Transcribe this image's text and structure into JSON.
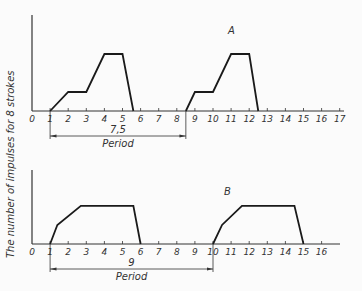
{
  "y_axis_label": "The number of impulses for 8 strokes",
  "panels": [
    {
      "id": "A",
      "label": "A",
      "x_ticks": [
        "0",
        "1",
        "2",
        "3",
        "4",
        "5",
        "6",
        "7",
        "8",
        "9",
        "10",
        "11",
        "12",
        "13",
        "14",
        "15",
        "16",
        "17"
      ],
      "period_value": "7,5",
      "period_label": "Period",
      "period_from": 1,
      "period_to": 8.5
    },
    {
      "id": "B",
      "label": "B",
      "x_ticks": [
        "0",
        "1",
        "2",
        "3",
        "4",
        "5",
        "6",
        "7",
        "8",
        "9",
        "10",
        "11",
        "12",
        "13",
        "14",
        "15",
        "16"
      ],
      "period_value": "9",
      "period_label": "Period",
      "period_from": 1,
      "period_to": 10
    }
  ],
  "chart_data": [
    {
      "type": "line",
      "title": "A",
      "xlabel": "",
      "ylabel": "The number of impulses for 8 strokes",
      "xlim": [
        0,
        17
      ],
      "series": [
        {
          "name": "cycle 1",
          "x": [
            1,
            2,
            3,
            4,
            5,
            5.6
          ],
          "y": [
            0,
            1,
            1,
            3,
            3,
            0
          ]
        },
        {
          "name": "cycle 2",
          "x": [
            8.5,
            9,
            10,
            11,
            12,
            12.5
          ],
          "y": [
            0,
            1,
            1,
            3,
            3,
            0
          ]
        }
      ],
      "annotations": [
        {
          "text": "7,5",
          "subtext": "Period",
          "from": 1,
          "to": 8.5
        }
      ]
    },
    {
      "type": "line",
      "title": "B",
      "xlabel": "",
      "ylabel": "The number of impulses for 8 strokes",
      "xlim": [
        0,
        16
      ],
      "series": [
        {
          "name": "cycle 1",
          "x": [
            1,
            1.4,
            2.7,
            5.6,
            6
          ],
          "y": [
            0,
            1.5,
            3,
            3,
            0
          ]
        },
        {
          "name": "cycle 2",
          "x": [
            10,
            10.5,
            11.6,
            14.5,
            15
          ],
          "y": [
            0,
            1.5,
            3,
            3,
            0
          ]
        }
      ],
      "annotations": [
        {
          "text": "9",
          "subtext": "Period",
          "from": 1,
          "to": 10
        }
      ]
    }
  ]
}
